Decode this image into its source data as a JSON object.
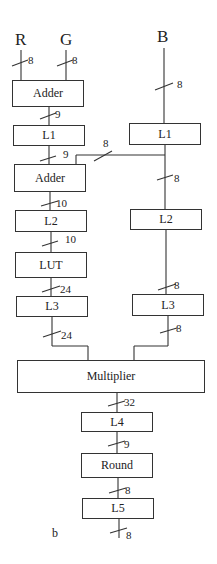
{
  "inputs": {
    "r": "R",
    "g": "G",
    "b": "B"
  },
  "output": "b",
  "blocks": {
    "adder1": "Adder",
    "l1_left": "L1",
    "adder2": "Adder",
    "l2_left": "L2",
    "lut": "LUT",
    "l3_left": "L3",
    "l1_right": "L1",
    "l2_right": "L2",
    "l3_right": "L3",
    "multiplier": "Multiplier",
    "l4": "L4",
    "round": "Round",
    "l5": "L5"
  },
  "widths": {
    "r_in": "8",
    "g_in": "8",
    "b_in": "8",
    "adder1_out": "9",
    "l1_left_out": "9",
    "branch": "8",
    "l1_right_out": "8",
    "adder2_out": "10",
    "l2_left_out": "10",
    "lut_out": "24",
    "l2_right_out": "8",
    "l3_left_out": "24",
    "l3_right_out": "8",
    "mult_out": "32",
    "l4_out": "9",
    "round_out": "8",
    "l5_out": "8"
  }
}
